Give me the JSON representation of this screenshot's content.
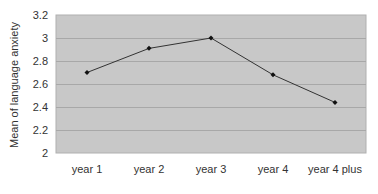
{
  "chart_data": {
    "type": "line",
    "title": "",
    "xlabel": "",
    "ylabel": "Mean of language anxiety",
    "categories": [
      "year 1",
      "year 2",
      "year 3",
      "year 4",
      "year 4 plus"
    ],
    "series": [
      {
        "name": "Mean of language anxiety",
        "values": [
          2.7,
          2.91,
          3.0,
          2.68,
          2.44
        ]
      }
    ],
    "ylim": [
      2,
      3.2
    ],
    "yticks": [
      "2",
      "2.2",
      "2.4",
      "2.6",
      "2.8",
      "3",
      "3.2"
    ],
    "grid": true,
    "legend": "none",
    "colors": {
      "plot_bg": "#c8c8c8",
      "grid": "#a8a8a8",
      "line": "#333333",
      "marker": "#111111"
    }
  }
}
